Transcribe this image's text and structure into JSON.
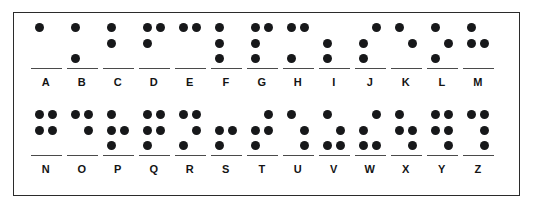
{
  "chart": {
    "dot_color": "#17181a",
    "underline_color": "#4a4a4a",
    "border_color": "#2b2b2b",
    "background_color": "#ffffff",
    "cell_rows": 3,
    "cell_columns": 2,
    "dot_numbering": "1=top-left, 2=middle-left, 3=bottom-left, 4=top-right, 5=middle-right, 6=bottom-right"
  },
  "rows": [
    {
      "name": "row-top",
      "letters": [
        {
          "label": "A",
          "dots": [
            1,
            0,
            0,
            0,
            0,
            0
          ]
        },
        {
          "label": "B",
          "dots": [
            1,
            0,
            1,
            0,
            0,
            0
          ]
        },
        {
          "label": "C",
          "dots": [
            1,
            1,
            0,
            0,
            0,
            0
          ]
        },
        {
          "label": "D",
          "dots": [
            1,
            1,
            0,
            1,
            0,
            0
          ]
        },
        {
          "label": "E",
          "dots": [
            1,
            0,
            0,
            1,
            0,
            0
          ]
        },
        {
          "label": "F",
          "dots": [
            1,
            1,
            1,
            0,
            0,
            0
          ]
        },
        {
          "label": "G",
          "dots": [
            1,
            1,
            1,
            1,
            0,
            0
          ]
        },
        {
          "label": "H",
          "dots": [
            1,
            0,
            1,
            1,
            0,
            0
          ]
        },
        {
          "label": "I",
          "dots": [
            0,
            1,
            1,
            0,
            0,
            0
          ]
        },
        {
          "label": "J",
          "dots": [
            0,
            1,
            1,
            1,
            0,
            0
          ]
        },
        {
          "label": "K",
          "dots": [
            1,
            0,
            0,
            0,
            1,
            0
          ]
        },
        {
          "label": "L",
          "dots": [
            1,
            0,
            1,
            0,
            1,
            0
          ]
        },
        {
          "label": "M",
          "dots": [
            1,
            1,
            0,
            0,
            1,
            0
          ]
        }
      ]
    },
    {
      "name": "row-bottom",
      "letters": [
        {
          "label": "N",
          "dots": [
            1,
            1,
            0,
            1,
            1,
            0
          ]
        },
        {
          "label": "O",
          "dots": [
            1,
            0,
            0,
            1,
            1,
            0
          ]
        },
        {
          "label": "P",
          "dots": [
            1,
            1,
            1,
            0,
            1,
            0
          ]
        },
        {
          "label": "Q",
          "dots": [
            1,
            1,
            1,
            1,
            1,
            0
          ]
        },
        {
          "label": "R",
          "dots": [
            1,
            0,
            1,
            1,
            1,
            0
          ]
        },
        {
          "label": "S",
          "dots": [
            0,
            1,
            1,
            0,
            1,
            0
          ]
        },
        {
          "label": "T",
          "dots": [
            0,
            1,
            1,
            1,
            1,
            0
          ]
        },
        {
          "label": "U",
          "dots": [
            1,
            0,
            0,
            0,
            1,
            1
          ]
        },
        {
          "label": "V",
          "dots": [
            1,
            0,
            1,
            0,
            1,
            1
          ]
        },
        {
          "label": "W",
          "dots": [
            0,
            1,
            1,
            1,
            0,
            1
          ]
        },
        {
          "label": "X",
          "dots": [
            1,
            1,
            0,
            0,
            1,
            1
          ]
        },
        {
          "label": "Y",
          "dots": [
            1,
            1,
            0,
            1,
            1,
            1
          ]
        },
        {
          "label": "Z",
          "dots": [
            1,
            0,
            0,
            1,
            1,
            1
          ]
        }
      ]
    }
  ]
}
